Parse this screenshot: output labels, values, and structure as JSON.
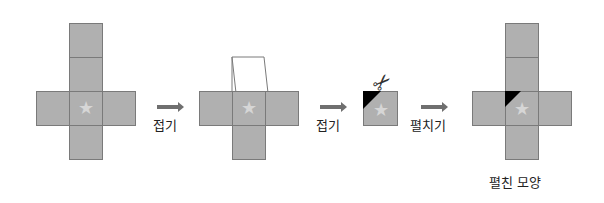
{
  "steps": {
    "fold1_label": "접기",
    "fold2_label": "접기",
    "unfold_label": "펼치기",
    "result_label": "펼친 모양"
  },
  "icons": {
    "star": "★",
    "scissors": "✂"
  },
  "colors": {
    "face": "#b0b0b0",
    "edge": "#7a7a7a",
    "star": "#d6d6d6",
    "cut": "#000000",
    "arrow": "#6f6f6f"
  }
}
